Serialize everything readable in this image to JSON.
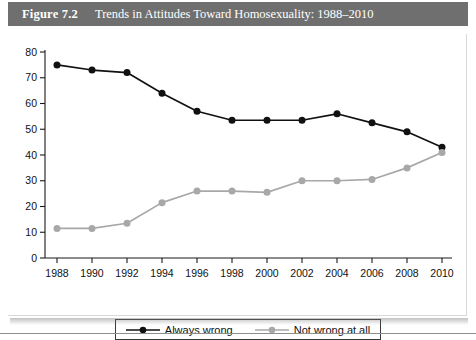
{
  "figure": {
    "label": "Figure 7.2",
    "title": "Trends in Attitudes Toward Homosexuality: 1988–2010",
    "header_bg": "#6f6f6f",
    "header_text_color": "#ffffff"
  },
  "colors": {
    "series_always_wrong": "#111111",
    "series_not_wrong_at_all": "#a8a8a8",
    "axis": "#1a1a1a",
    "plot_background": "#ffffff"
  },
  "legend": {
    "position": "bottom-center",
    "entries": [
      {
        "label": "Always wrong",
        "color": "#111111"
      },
      {
        "label": "Not wrong at all",
        "color": "#a8a8a8"
      }
    ]
  },
  "axes": {
    "y_ticks": [
      "0",
      "10",
      "20",
      "30",
      "40",
      "50",
      "60",
      "70",
      "80"
    ],
    "x_ticks": [
      "1988",
      "1990",
      "1992",
      "1994",
      "1996",
      "1998",
      "2000",
      "2002",
      "2004",
      "2006",
      "2008",
      "2010"
    ]
  },
  "chart_data": {
    "type": "line",
    "title": "Trends in Attitudes Toward Homosexuality: 1988–2010",
    "xlabel": "",
    "ylabel": "",
    "xlim": [
      1988,
      2010
    ],
    "ylim": [
      0,
      80
    ],
    "ytick_step": 10,
    "grid": false,
    "legend_position": "bottom-center",
    "x": [
      1988,
      1990,
      1992,
      1994,
      1996,
      1998,
      2000,
      2002,
      2004,
      2006,
      2008,
      2010
    ],
    "categories": [
      "1988",
      "1990",
      "1992",
      "1994",
      "1996",
      "1998",
      "2000",
      "2002",
      "2004",
      "2006",
      "2008",
      "2010"
    ],
    "series": [
      {
        "name": "Always wrong",
        "color": "#111111",
        "marker": "circle",
        "values": [
          75,
          73,
          72,
          64,
          57,
          53.5,
          53.5,
          53.5,
          56,
          52.5,
          49,
          43
        ]
      },
      {
        "name": "Not wrong at all",
        "color": "#a8a8a8",
        "marker": "circle",
        "values": [
          11.5,
          11.5,
          13.5,
          21.5,
          26,
          26,
          25.5,
          30,
          30,
          30.5,
          35,
          41
        ]
      }
    ]
  }
}
